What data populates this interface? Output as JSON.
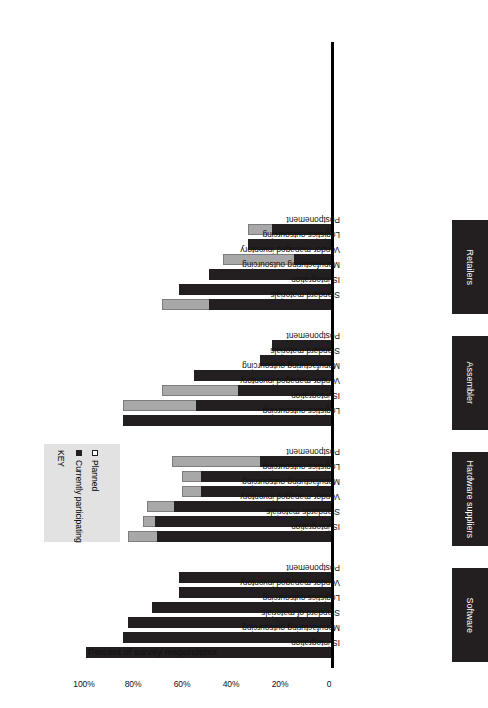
{
  "chart_data": {
    "type": "bar",
    "orientation": "horizontal",
    "title": "",
    "xlabel": "Percent of survey respondents",
    "ylabel": "",
    "xlim": [
      0,
      100
    ],
    "grid": false,
    "stacked": true,
    "legend": {
      "title": "KEY",
      "position": "upper-right",
      "entries": [
        {
          "name": "Currently participating",
          "color": "#231f20",
          "marker": "filled-square"
        },
        {
          "name": "Planned",
          "color": "#ffffff",
          "marker": "hollow-square"
        }
      ]
    },
    "tick_labels": [
      "0",
      "20%",
      "40%",
      "60%",
      "80%",
      "100%"
    ],
    "tick_values": [
      0,
      20,
      40,
      60,
      80,
      100
    ],
    "series": [
      {
        "name": "Currently participating",
        "color": "#231f20"
      },
      {
        "name": "Planned",
        "color": "#a8a8a8"
      }
    ],
    "groups": [
      {
        "name": "Software",
        "categories": [
          "IS integration",
          "Manufacturing outsourcing",
          "Standard of materials",
          "Logistics outsourcing",
          "Vendor-managed inventory",
          "Postponement"
        ],
        "currently_participating": [
          100,
          85,
          83,
          73,
          62,
          62
        ],
        "total": [
          100,
          85,
          83,
          73,
          62,
          62
        ]
      },
      {
        "name": "Hardware suppliers",
        "categories": [
          "IS integration",
          "Standards materials",
          "Vendor-managed inventory",
          "Manufacturing outsourcing",
          "Logistics outsourcing",
          "Postponement"
        ],
        "currently_participating": [
          71,
          72,
          64,
          53,
          53,
          29
        ],
        "total": [
          83,
          77,
          75,
          61,
          61,
          65
        ]
      },
      {
        "name": "Assembler",
        "categories": [
          "Logistics outsourcing",
          "IS integration",
          "Vendor-managed inventory",
          "Manufacturing outsourcing",
          "Standard materials",
          "Postponement"
        ],
        "currently_participating": [
          85,
          55,
          38,
          56,
          29,
          24
        ],
        "total": [
          85,
          85,
          69,
          56,
          29,
          24
        ]
      },
      {
        "name": "Retailers",
        "categories": [
          "Standard materials",
          "IS integration",
          "Manufacturing outsourcing",
          "Vendor-managed inventory",
          "Logistics outsourcing",
          "Postponement"
        ],
        "currently_participating": [
          50,
          62,
          50,
          15,
          34,
          24
        ],
        "total": [
          69,
          62,
          50,
          44,
          34,
          34
        ]
      }
    ]
  }
}
